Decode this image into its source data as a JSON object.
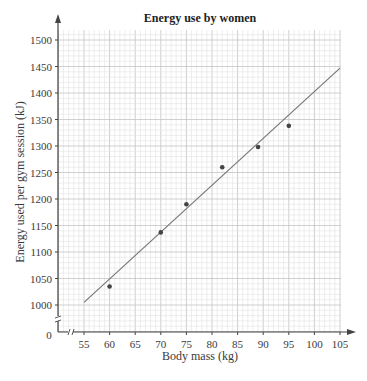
{
  "chart_data": {
    "type": "scatter",
    "title": "Energy use by women",
    "xlabel": "Body mass (kg)",
    "ylabel": "Energy used per gym session (kJ)",
    "xlim": [
      50,
      105
    ],
    "ylim": [
      950,
      1520
    ],
    "x_ticks": [
      55,
      60,
      65,
      70,
      75,
      80,
      85,
      90,
      95,
      100,
      105
    ],
    "y_ticks": [
      1000,
      1050,
      1100,
      1150,
      1200,
      1250,
      1300,
      1350,
      1400,
      1450,
      1500
    ],
    "origin_label": "0",
    "axis_breaks": true,
    "grid": true,
    "points": [
      {
        "x": 60,
        "y": 1035
      },
      {
        "x": 70,
        "y": 1137
      },
      {
        "x": 75,
        "y": 1190
      },
      {
        "x": 82,
        "y": 1260
      },
      {
        "x": 89,
        "y": 1298
      },
      {
        "x": 95,
        "y": 1338
      }
    ],
    "trend_line": {
      "x1": 55,
      "y1": 1005,
      "x2": 105,
      "y2": 1447
    },
    "colors": {
      "grid_minor": "#dcdcdc",
      "grid_major": "#c4c4c4",
      "axis": "#444444",
      "point": "#444444",
      "line": "#777777"
    }
  }
}
